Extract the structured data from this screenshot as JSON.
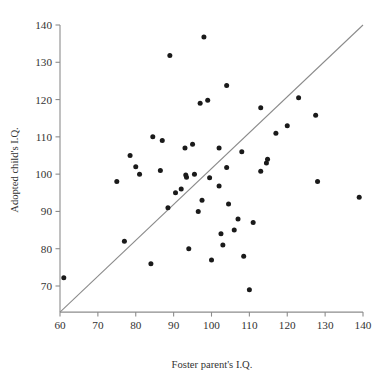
{
  "chart_data": {
    "type": "scatter",
    "title": "",
    "xlabel": "Foster parent's I.Q.",
    "ylabel": "Adopted child's I.Q.",
    "xlim": [
      60,
      140
    ],
    "ylim": [
      63,
      140
    ],
    "xticks": [
      60,
      70,
      80,
      90,
      100,
      110,
      120,
      130,
      140
    ],
    "yticks": [
      70,
      80,
      90,
      100,
      110,
      120,
      130,
      140
    ],
    "xtick_labels": [
      "60",
      "70",
      "80",
      "90",
      "100",
      "110",
      "120",
      "130",
      "140"
    ],
    "ytick_labels": [
      "70",
      "80",
      "90",
      "100",
      "110",
      "120",
      "130",
      "140"
    ],
    "grid": false,
    "legend": "none",
    "marker": "filled-circle",
    "marker_color": "#1a1a1a",
    "reference_line": {
      "name": "identity-line",
      "from": [
        60,
        63
      ],
      "to": [
        140,
        140
      ],
      "color": "#8a8a8a"
    },
    "series": [
      {
        "name": "adopted-child-vs-foster-parent",
        "points": [
          [
            61,
            72.2
          ],
          [
            75,
            98.0
          ],
          [
            77,
            82.0
          ],
          [
            78.5,
            105.0
          ],
          [
            80,
            102.0
          ],
          [
            81,
            100.0
          ],
          [
            84,
            76.0
          ],
          [
            86.5,
            101.0
          ],
          [
            87,
            109.0
          ],
          [
            84.5,
            110.0
          ],
          [
            88.5,
            91.0
          ],
          [
            89,
            131.8
          ],
          [
            90.5,
            95.0
          ],
          [
            92,
            96.0
          ],
          [
            93,
            107.0
          ],
          [
            93.2,
            99.8
          ],
          [
            93.4,
            99.2
          ],
          [
            94,
            80.0
          ],
          [
            95,
            108.0
          ],
          [
            95.5,
            100.0
          ],
          [
            96.5,
            90.0
          ],
          [
            97,
            119.0
          ],
          [
            97.5,
            93.0
          ],
          [
            98,
            136.8
          ],
          [
            99,
            119.8
          ],
          [
            99.5,
            99.0
          ],
          [
            100,
            77.0
          ],
          [
            102,
            107.0
          ],
          [
            102,
            96.8
          ],
          [
            102.5,
            84.0
          ],
          [
            103,
            81.0
          ],
          [
            104,
            123.8
          ],
          [
            104,
            101.8
          ],
          [
            104.5,
            92.0
          ],
          [
            106,
            85.0
          ],
          [
            107,
            88.0
          ],
          [
            108,
            106.0
          ],
          [
            108.5,
            78.0
          ],
          [
            110,
            69.0
          ],
          [
            111,
            87.0
          ],
          [
            113,
            117.8
          ],
          [
            113,
            100.8
          ],
          [
            114.5,
            103.0
          ],
          [
            114.8,
            104.0
          ],
          [
            117,
            111.0
          ],
          [
            120,
            113.0
          ],
          [
            123,
            120.5
          ],
          [
            127.5,
            115.8
          ],
          [
            128,
            98.0
          ],
          [
            139,
            93.8
          ]
        ]
      }
    ]
  },
  "axis": {
    "x_title": "Foster parent's I.Q.",
    "y_title": "Adopted child's I.Q."
  }
}
